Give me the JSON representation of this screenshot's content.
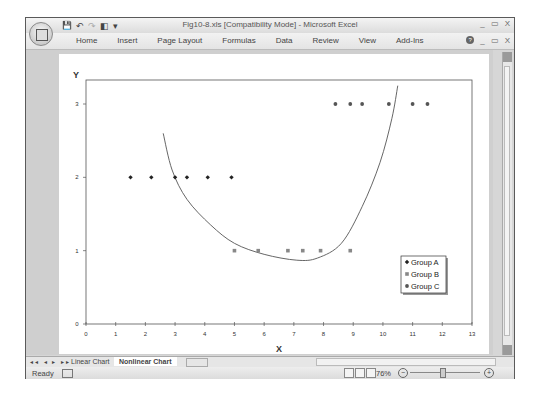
{
  "window": {
    "title": "Fig10-8.xls  [Compatibility Mode] - Microsoft Excel",
    "controls": [
      "_",
      "▭",
      "X"
    ]
  },
  "quick_access": {
    "save": "💾",
    "undo": "↶",
    "redo": "↷",
    "extra": "◧",
    "customize": "▾"
  },
  "ribbon": {
    "tabs": [
      "Home",
      "Insert",
      "Page Layout",
      "Formulas",
      "Data",
      "Review",
      "View",
      "Add-Ins"
    ],
    "help": "?",
    "doc_controls": [
      "_",
      "▭",
      "X"
    ]
  },
  "chart_data": {
    "type": "scatter",
    "title": "",
    "xlabel": "X",
    "ylabel": "Y",
    "xlim": [
      0,
      13
    ],
    "ylim": [
      0,
      3.3
    ],
    "x_ticks": [
      "0",
      "1",
      "2",
      "3",
      "4",
      "5",
      "6",
      "7",
      "8",
      "9",
      "10",
      "11",
      "12",
      "13"
    ],
    "y_ticks": [
      "0",
      "1",
      "2",
      "3"
    ],
    "grid": false,
    "legend_position": "inside-lower-right",
    "series": [
      {
        "name": "Group A",
        "marker": "diamond",
        "color": "#222222",
        "x": [
          1.5,
          2.2,
          3.0,
          3.4,
          4.1,
          4.9
        ],
        "y": [
          2,
          2,
          2,
          2,
          2,
          2
        ]
      },
      {
        "name": "Group B",
        "marker": "square",
        "color": "#888888",
        "x": [
          5.0,
          5.8,
          6.8,
          7.3,
          7.9,
          8.9
        ],
        "y": [
          1,
          1,
          1,
          1,
          1,
          1
        ]
      },
      {
        "name": "Group C",
        "marker": "circle",
        "color": "#555555",
        "x": [
          8.4,
          8.9,
          9.3,
          10.2,
          11.0,
          11.5
        ],
        "y": [
          3,
          3,
          3,
          3,
          3,
          3
        ]
      }
    ],
    "annotations": [
      {
        "type": "curve",
        "description": "U-shaped nonlinear boundary",
        "points": [
          [
            2.6,
            2.6
          ],
          [
            2.9,
            2.1
          ],
          [
            3.4,
            1.7
          ],
          [
            4.2,
            1.35
          ],
          [
            5.0,
            1.1
          ],
          [
            6.0,
            0.95
          ],
          [
            7.1,
            0.87
          ],
          [
            7.8,
            0.9
          ],
          [
            8.6,
            1.1
          ],
          [
            9.3,
            1.6
          ],
          [
            9.9,
            2.2
          ],
          [
            10.3,
            2.8
          ],
          [
            10.5,
            3.25
          ]
        ]
      }
    ]
  },
  "sheets": {
    "nav": "◂◂ ◂ ▸ ▸▸",
    "tabs": [
      "Linear Chart",
      "Nonlinear Chart"
    ],
    "active": "Nonlinear Chart"
  },
  "status": {
    "text": "Ready",
    "zoom": "76%",
    "zoom_out": "−",
    "zoom_in": "+"
  }
}
